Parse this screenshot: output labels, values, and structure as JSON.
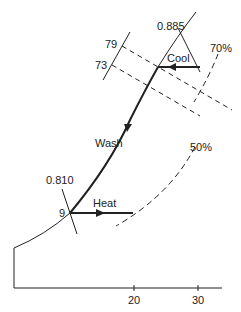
{
  "diagram": {
    "type": "psychrometric-process",
    "axis": {
      "ticks": [
        {
          "value": "20"
        },
        {
          "value": "30"
        }
      ]
    },
    "labels": {
      "wet_bulb_high": "79",
      "wet_bulb_low": "73",
      "specific_volume_top": "0.885",
      "specific_volume_bottom": "0.810",
      "rh_70": "70%",
      "rh_50": "50%",
      "point_9": "9"
    },
    "processes": [
      {
        "name": "Cool"
      },
      {
        "name": "Wash"
      },
      {
        "name": "Heat"
      }
    ],
    "colors": {
      "line": "#222222",
      "background": "#ffffff"
    }
  }
}
